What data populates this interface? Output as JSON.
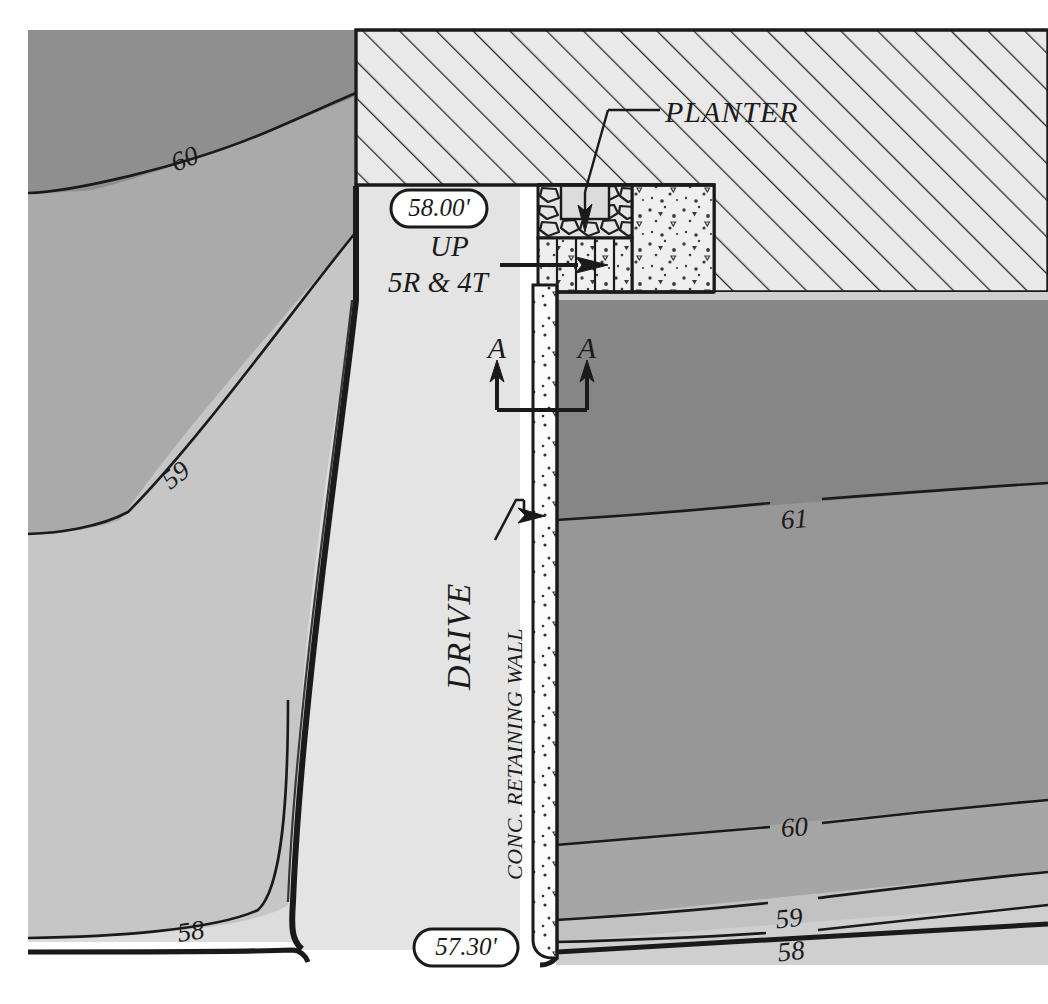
{
  "drawing": {
    "type": "architectural-site-grading-plan",
    "title": "Site Grading Plan - Drive, Retaining Wall and Entry Stair",
    "background_color": "#ffffff",
    "line_color": "#1a1a1a"
  },
  "labels": {
    "planter": "PLANTER",
    "drive": "DRIVE",
    "retaining_wall": "CONC. RETAINING WALL",
    "up": "UP",
    "stair_note": "5R & 4T",
    "section_left": "A",
    "section_right": "A"
  },
  "spot_elevations": [
    {
      "id": "landing",
      "text": "58.00'",
      "x": 432,
      "y": 208
    },
    {
      "id": "drive-low",
      "text": "57.30'",
      "x": 466,
      "y": 947
    }
  ],
  "contours": {
    "interval_ft": 1,
    "labels_left": [
      {
        "text": "60",
        "x": 188,
        "y": 158
      },
      {
        "text": "59",
        "x": 181,
        "y": 473
      },
      {
        "text": "58",
        "x": 192,
        "y": 931
      }
    ],
    "labels_right": [
      {
        "text": "61",
        "x": 795,
        "y": 518
      },
      {
        "text": "60",
        "x": 795,
        "y": 826
      },
      {
        "text": "59",
        "x": 789,
        "y": 917
      },
      {
        "text": "58",
        "x": 792,
        "y": 950
      }
    ]
  },
  "fills": {
    "paper": "#ffffff",
    "grade_60_61": "#8f8f8f",
    "grade_59_60": "#a8a8a8",
    "grade_58_59": "#c4c4c4",
    "grade_below_58": "#dcdcdc",
    "drive_surface": "#e2e2e2",
    "building_hatch_bg": "#e8e8e8",
    "concrete_stipple_bg": "#ececec",
    "wall_concrete": "#fbfbfb",
    "planter_void": "#d8d8d8",
    "right_upper_grade": "#8a8a8a",
    "right_mid_grade": "#a2a2a2"
  },
  "elements": {
    "building": {
      "name": "building-hatched-area",
      "hatch_angle_deg": 45
    },
    "planter_box": {
      "name": "planter-stone-wall"
    },
    "stair": {
      "name": "entry-stair",
      "risers": 5,
      "treads": 4
    },
    "concrete_pad": {
      "name": "concrete-pad"
    },
    "retaining_wall": {
      "name": "concrete-retaining-wall"
    },
    "section_cut": {
      "name": "section-cut-a-a"
    }
  }
}
